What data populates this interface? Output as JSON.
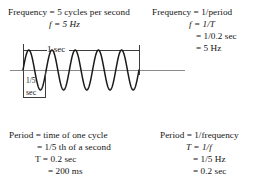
{
  "figure": {
    "type": "waveform-diagram",
    "topic": "Frequency and period of a 5 Hz sine wave",
    "frequency_left": {
      "line1": "Frequency = 5 cycles per second",
      "line2": "f = 5 Hz"
    },
    "frequency_right": {
      "line1": "Frequency = 1/period",
      "line2": "f = 1/T",
      "line3": "= 1/0.2 sec",
      "line4": "= 5 Hz"
    },
    "period_left": {
      "line1": "Period = time of one cycle",
      "line2": "= 1/5 th of a second",
      "line3": "T = 0.2 sec",
      "line4": "= 200 ms"
    },
    "period_right": {
      "line1": "Period = 1/frequency",
      "line2": "T = 1/f",
      "line3": "= 1/5 Hz",
      "line4": "= 0.2 sec"
    },
    "annotations": {
      "one_second_label": "1 sec",
      "fifth_second_numerator": "1/5",
      "fifth_second_unit": "sec"
    },
    "colors": {
      "wave_stroke": "#1a1a1a",
      "axis_stroke": "#8a8a8a",
      "dimension_stroke": "#3d3d3d",
      "text": "#141414",
      "background": "#ffffff"
    }
  },
  "chart_data": {
    "type": "line",
    "title": "",
    "xlabel": "",
    "ylabel": "",
    "cycles_shown": 5,
    "frequency_hz": 5,
    "period_seconds": 0.2,
    "period_milliseconds": 200,
    "x_span_seconds": 1,
    "amplitude": 1,
    "xlim": [
      0,
      1
    ],
    "ylim": [
      -1,
      1
    ],
    "grid": false,
    "legend": null,
    "series": [
      {
        "name": "sine wave",
        "equation": "y = sin(2*pi*5*t)"
      }
    ]
  }
}
